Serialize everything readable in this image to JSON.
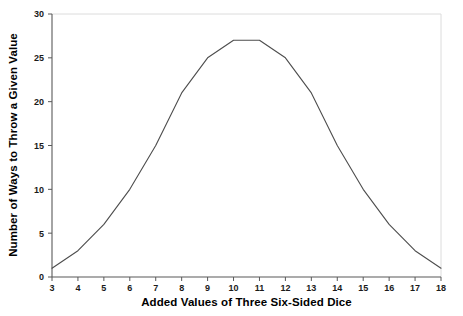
{
  "chart_data": {
    "type": "line",
    "title": "",
    "xlabel": "Added Values of Three Six-Sided Dice",
    "ylabel": "Number of Ways to Throw a Given Value",
    "x": [
      3,
      4,
      5,
      6,
      7,
      8,
      9,
      10,
      11,
      12,
      13,
      14,
      15,
      16,
      17,
      18
    ],
    "values": [
      1,
      3,
      6,
      10,
      15,
      21,
      25,
      27,
      27,
      25,
      21,
      15,
      10,
      6,
      3,
      1
    ],
    "series": [
      {
        "name": "Number of Ways",
        "values": [
          1,
          3,
          6,
          10,
          15,
          21,
          25,
          27,
          27,
          25,
          21,
          15,
          10,
          6,
          3,
          1
        ]
      }
    ],
    "xlim": [
      3,
      18
    ],
    "ylim": [
      0,
      30
    ],
    "xticks": [
      "3",
      "4",
      "5",
      "6",
      "7",
      "8",
      "9",
      "10",
      "11",
      "12",
      "13",
      "14",
      "15",
      "16",
      "17",
      "18"
    ],
    "yticks": [
      "0",
      "5",
      "10",
      "15",
      "20",
      "25",
      "30"
    ],
    "ytick_values": [
      0,
      5,
      10,
      15,
      20,
      25,
      30
    ],
    "grid": false,
    "legend": "none",
    "line_color": "#4d4d4d",
    "axis_color": "#4d4d4d",
    "frame_color": "#d9d9d9",
    "background": "#ffffff"
  }
}
